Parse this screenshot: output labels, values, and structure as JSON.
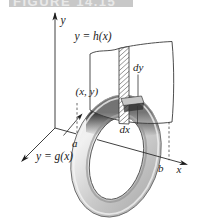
{
  "figure_banner": {
    "text": "FIGURE 14.15"
  },
  "diagram": {
    "axes": {
      "x_label": "x",
      "y_label": "y"
    },
    "curves": {
      "upper": "y = h(x)",
      "lower": "y = g(x)"
    },
    "annotations": {
      "point": "(x, y)",
      "vertical_thickness": "dy",
      "horizontal_thickness": "dx",
      "left_bound": "a",
      "right_bound": "b"
    }
  },
  "colors": {
    "banner_bg": "#c8c8c8",
    "banner_text": "#e9e9e9",
    "line": "#333333",
    "ring_light": "#e6e6e6",
    "ring_mid": "#a9a9a9",
    "ring_shadow": "#2e2e2e"
  }
}
